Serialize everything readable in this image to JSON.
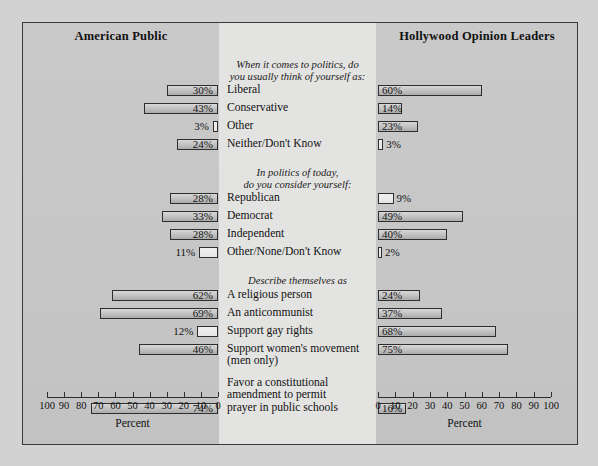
{
  "figure": {
    "left_panel_title": "American Public",
    "right_panel_title": "Hollywood Opinion Leaders",
    "axis_title_left": "Percent",
    "axis_title_right": "Percent"
  },
  "axes": {
    "left_ticks": [
      "100",
      "90",
      "80",
      "70",
      "60",
      "50",
      "40",
      "30",
      "20",
      "10",
      "0"
    ],
    "right_ticks": [
      "0",
      "10",
      "20",
      "30",
      "40",
      "50",
      "60",
      "70",
      "80",
      "90",
      "100"
    ],
    "min": 0,
    "max": 100
  },
  "groups": [
    {
      "header": "When it comes to politics, do\nyou usually think of yourself as:",
      "header_line1": "When it comes to politics, do",
      "header_line2": "you usually think of yourself as:",
      "items": [
        {
          "label": "Liberal",
          "left": 30,
          "right": 60,
          "left_value": "30%",
          "right_value": "60%"
        },
        {
          "label": "Conservative",
          "left": 43,
          "right": 14,
          "left_value": "43%",
          "right_value": "14%"
        },
        {
          "label": "Other",
          "left": 3,
          "right": 23,
          "left_value": "3%",
          "right_value": "23%"
        },
        {
          "label": "Neither/Don't Know",
          "left": 24,
          "right": 3,
          "left_value": "24%",
          "right_value": "3%"
        }
      ]
    },
    {
      "header_line1": "In politics of today,",
      "header_line2": "do you consider yourself:",
      "items": [
        {
          "label": "Republican",
          "left": 28,
          "right": 9,
          "left_value": "28%",
          "right_value": "9%"
        },
        {
          "label": "Democrat",
          "left": 33,
          "right": 49,
          "left_value": "33%",
          "right_value": "49%"
        },
        {
          "label": "Independent",
          "left": 28,
          "right": 40,
          "left_value": "28%",
          "right_value": "40%"
        },
        {
          "label": "Other/None/Don't Know",
          "left": 11,
          "right": 2,
          "left_value": "11%",
          "right_value": "2%"
        }
      ]
    },
    {
      "header_line1": "Describe themselves as",
      "header_line2": "",
      "items": [
        {
          "label": "A religious person",
          "left": 62,
          "right": 24,
          "left_value": "62%",
          "right_value": "24%"
        },
        {
          "label": "An anticommunist",
          "left": 69,
          "right": 37,
          "left_value": "69%",
          "right_value": "37%"
        },
        {
          "label": "Support gay rights",
          "left": 12,
          "right": 68,
          "left_value": "12%",
          "right_value": "68%"
        },
        {
          "label": "Support women's movement\n(men only)",
          "label_line1": "Support women's movement",
          "label_line2": "(men only)",
          "left": 46,
          "right": 75,
          "left_value": "46%",
          "right_value": "75%"
        }
      ]
    },
    {
      "header_line1": "",
      "header_line2": "",
      "items": [
        {
          "label": "Favor a constitutional\namendment to permit\nprayer in public schools",
          "label_line1": "Favor a constitutional",
          "label_line2": "amendment to permit",
          "label_line3": "prayer in public schools",
          "left": 74,
          "right": 16,
          "left_value": "74%",
          "right_value": "16%"
        }
      ]
    }
  ],
  "chart_data": {
    "type": "bar",
    "orientation": "horizontal-diverging",
    "xlabel": "Percent",
    "ylabel": "",
    "xlim": [
      0,
      100
    ],
    "grid": false,
    "legend_position": "none",
    "categories": [
      "Liberal",
      "Conservative",
      "Other",
      "Neither/Don't Know",
      "Republican",
      "Democrat",
      "Independent",
      "Other/None/Don't Know",
      "A religious person",
      "An anticommunist",
      "Support gay rights",
      "Support women's movement (men only)",
      "Favor a constitutional amendment to permit prayer in public schools"
    ],
    "series": [
      {
        "name": "American Public",
        "values": [
          30,
          43,
          3,
          24,
          28,
          33,
          28,
          11,
          62,
          69,
          12,
          46,
          74
        ]
      },
      {
        "name": "Hollywood Opinion Leaders",
        "values": [
          60,
          14,
          23,
          3,
          9,
          49,
          40,
          2,
          24,
          37,
          68,
          75,
          16
        ]
      }
    ],
    "group_headers": [
      "When it comes to politics, do you usually think of yourself as:",
      "In politics of today, do you consider yourself:",
      "Describe themselves as"
    ]
  },
  "colors": {
    "page_background": "#d2d2d2",
    "panel_outer": "#c9c9c9",
    "panel_center": "#e3e3e1",
    "bar_outline": "#2e2e2e",
    "text": "#121212"
  }
}
